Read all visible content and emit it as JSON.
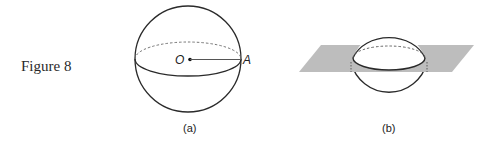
{
  "figure": {
    "title": "Figure 8",
    "panels": [
      {
        "id": "a",
        "caption": "(a)",
        "points": {
          "center": "O",
          "surface": "A"
        }
      },
      {
        "id": "b",
        "caption": "(b)"
      }
    ]
  },
  "colors": {
    "stroke": "#2a2a2a",
    "plane": "#b9b9b9",
    "dashed": "#555555"
  }
}
